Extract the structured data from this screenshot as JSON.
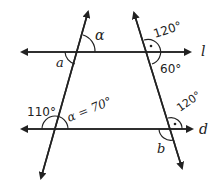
{
  "diagram": {
    "lines": {
      "l": {
        "label": "l"
      },
      "d": {
        "label": "d"
      }
    },
    "angles": {
      "top_left_upper": {
        "label": "α"
      },
      "top_left_lower": {
        "label": "a"
      },
      "top_right_upper": {
        "label": "120°"
      },
      "top_right_lower": {
        "label": "60°"
      },
      "bottom_left_outer": {
        "label": "110°"
      },
      "bottom_left_inner": {
        "label": "α = 70°"
      },
      "bottom_right_upper": {
        "label": "120°"
      },
      "bottom_right_lower": {
        "label": "b"
      }
    },
    "colors": {
      "stroke": "#222222",
      "background": "#ffffff"
    }
  }
}
